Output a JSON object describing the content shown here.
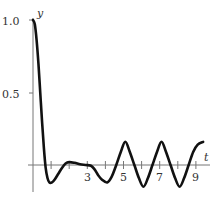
{
  "chart_data": {
    "type": "line",
    "title": "",
    "xlabel": "t",
    "ylabel": "y",
    "xlim": [
      0,
      9.5
    ],
    "ylim": [
      -0.2,
      1.0
    ],
    "grid": false,
    "legend": null,
    "x_ticks": [
      1,
      2,
      3,
      4,
      5,
      6,
      7,
      8,
      9
    ],
    "x_tick_labels": [
      "",
      "",
      "3",
      "",
      "5",
      "",
      "7",
      "",
      "9"
    ],
    "y_ticks": [
      0.5,
      1.0
    ],
    "y_tick_labels": [
      "0.5",
      "1.0"
    ],
    "series": [
      {
        "name": "y(t)",
        "color": "#111111",
        "x": [
          0,
          0.1,
          0.2,
          0.3,
          0.4,
          0.5,
          0.6,
          0.7,
          0.8,
          0.9,
          1.05,
          1.2,
          1.4,
          1.6,
          1.8,
          2.0,
          2.3,
          2.6,
          2.9,
          3.2,
          3.4,
          3.6,
          3.8,
          4.1,
          4.35,
          4.6,
          4.85,
          5.1,
          5.35,
          5.6,
          5.85,
          6.1,
          6.35,
          6.6,
          6.85,
          7.1,
          7.35,
          7.6,
          7.85,
          8.1,
          8.35,
          8.6,
          8.85,
          9.1,
          9.4
        ],
        "y": [
          1.0,
          0.97,
          0.86,
          0.7,
          0.5,
          0.3,
          0.12,
          -0.02,
          -0.09,
          -0.12,
          -0.12,
          -0.1,
          -0.06,
          -0.02,
          0.01,
          0.02,
          0.015,
          0.005,
          0.0,
          -0.005,
          -0.03,
          -0.07,
          -0.1,
          -0.12,
          -0.08,
          0.0,
          0.09,
          0.16,
          0.09,
          0.0,
          -0.09,
          -0.15,
          -0.09,
          0.0,
          0.09,
          0.16,
          0.09,
          0.0,
          -0.09,
          -0.15,
          -0.09,
          0.0,
          0.09,
          0.14,
          0.16
        ]
      }
    ]
  },
  "axes": {
    "x_label": "t",
    "y_label": "y",
    "y_tick_1": "1.0",
    "y_tick_05": "0.5",
    "x_tick_3": "3",
    "x_tick_5": "5",
    "x_tick_7": "7",
    "x_tick_9": "9"
  }
}
